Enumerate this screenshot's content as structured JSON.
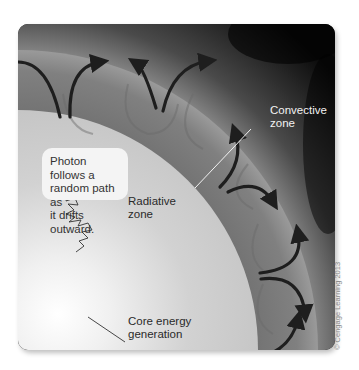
{
  "diagram": {
    "labels": {
      "convective_zone": [
        "Convective",
        "zone"
      ],
      "radiative_zone": [
        "Radiative",
        "zone"
      ],
      "core": [
        "Core energy",
        "generation"
      ]
    },
    "callout": {
      "lines": [
        "Photon follows a",
        "random path as",
        "it drifts outward."
      ]
    },
    "copyright": "© Cengage Learning 2013",
    "colors": {
      "space_dark": "#0a0a0a",
      "corona": "#6e6e6e",
      "convective_band": "#7d7d7d",
      "radiative": "#c9c9c9",
      "core_glow": "#ffffff",
      "arrows": "#1e1e1e"
    }
  }
}
